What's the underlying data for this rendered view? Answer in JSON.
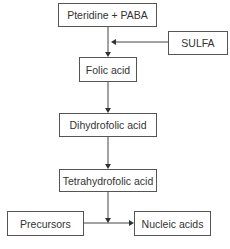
{
  "diagram": {
    "title": "",
    "nodes": [
      {
        "id": "pteridine_paba",
        "label": "Pteridine + PABA"
      },
      {
        "id": "sulfa",
        "label": "SULFA"
      },
      {
        "id": "folic_acid",
        "label": "Folic acid"
      },
      {
        "id": "dihydrofolic_acid",
        "label": "Dihydrofolic acid"
      },
      {
        "id": "tetrahydrofolic_acid",
        "label": "Tetrahydrofolic acid"
      },
      {
        "id": "precursors",
        "label": "Precursors"
      },
      {
        "id": "nucleic_acids",
        "label": "Nucleic acids"
      }
    ],
    "edges": [
      {
        "from": "pteridine_paba",
        "to": "folic_acid"
      },
      {
        "from": "sulfa",
        "to": "pteridine_paba->folic_acid",
        "type": "inhibition"
      },
      {
        "from": "folic_acid",
        "to": "dihydrofolic_acid"
      },
      {
        "from": "dihydrofolic_acid",
        "to": "tetrahydrofolic_acid"
      },
      {
        "from": "tetrahydrofolic_acid",
        "to": "precursors->nucleic_acids"
      },
      {
        "from": "precursors",
        "to": "nucleic_acids"
      }
    ],
    "colors": {
      "line": "#444444",
      "border": "#555555",
      "text": "#333333",
      "background": "#ffffff"
    }
  }
}
